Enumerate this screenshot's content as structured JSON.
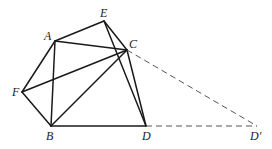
{
  "diagram": {
    "type": "geometry-figure",
    "colors": {
      "stroke": "#1a1a1a",
      "dashed_stroke": "#555555",
      "label": "#222222",
      "background": "#ffffff"
    },
    "points": [
      {
        "id": "A",
        "label": "A",
        "x": 55,
        "y": 41,
        "lx": 44,
        "ly": 40
      },
      {
        "id": "E",
        "label": "E",
        "x": 104,
        "y": 21,
        "lx": 100,
        "ly": 17
      },
      {
        "id": "C",
        "label": "C",
        "x": 127,
        "y": 50,
        "lx": 129,
        "ly": 48
      },
      {
        "id": "F",
        "label": "F",
        "x": 22,
        "y": 92,
        "lx": 12,
        "ly": 96
      },
      {
        "id": "B",
        "label": "B",
        "x": 51,
        "y": 126,
        "lx": 46,
        "ly": 140
      },
      {
        "id": "D",
        "label": "D",
        "x": 146,
        "y": 126,
        "lx": 142,
        "ly": 140
      },
      {
        "id": "D'",
        "label": "D′",
        "x": 257,
        "y": 126,
        "lx": 250,
        "ly": 140
      }
    ],
    "solid_segments": [
      [
        "A",
        "E"
      ],
      [
        "E",
        "C"
      ],
      [
        "A",
        "C"
      ],
      [
        "A",
        "F"
      ],
      [
        "F",
        "B"
      ],
      [
        "B",
        "D"
      ],
      [
        "A",
        "B"
      ],
      [
        "F",
        "C"
      ],
      [
        "B",
        "C"
      ],
      [
        "C",
        "D"
      ],
      [
        "E",
        "D"
      ]
    ],
    "dashed_segments": [
      [
        "C",
        "D'"
      ],
      [
        "D",
        "D'"
      ]
    ]
  }
}
